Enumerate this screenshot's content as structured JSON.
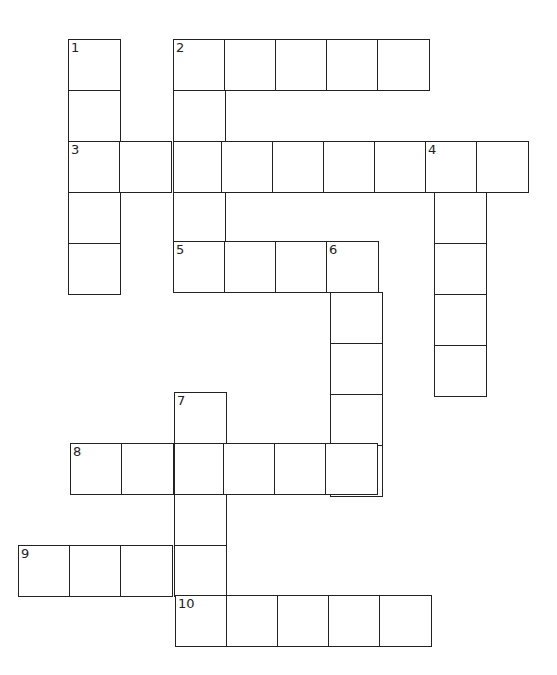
{
  "puzzle": {
    "type": "crossword",
    "cell_size": 52,
    "colors": {
      "border": "#222222",
      "background": "#ffffff",
      "number": "#222222"
    },
    "entries": [
      {
        "number": "1",
        "direction": "down",
        "length": 5,
        "x": 68,
        "y": 39
      },
      {
        "number": "2",
        "direction": "across",
        "length": 5,
        "x": 173,
        "y": 39
      },
      {
        "number": "2",
        "direction": "down",
        "length": 4,
        "x": 173,
        "y": 39
      },
      {
        "number": "3",
        "direction": "across",
        "length": 9,
        "x": 68,
        "y": 141
      },
      {
        "number": "4",
        "direction": "down",
        "length": 5,
        "x": 434,
        "y": 141
      },
      {
        "number": "5",
        "direction": "across",
        "length": 4,
        "x": 173,
        "y": 241
      },
      {
        "number": "6",
        "direction": "down",
        "length": 5,
        "x": 330,
        "y": 241
      },
      {
        "number": "7",
        "direction": "down",
        "length": 4,
        "x": 174,
        "y": 392
      },
      {
        "number": "8",
        "direction": "across",
        "length": 6,
        "x": 70,
        "y": 443
      },
      {
        "number": "9",
        "direction": "across",
        "length": 4,
        "x": 18,
        "y": 545
      },
      {
        "number": "10",
        "direction": "across",
        "length": 5,
        "x": 175,
        "y": 595
      }
    ]
  }
}
